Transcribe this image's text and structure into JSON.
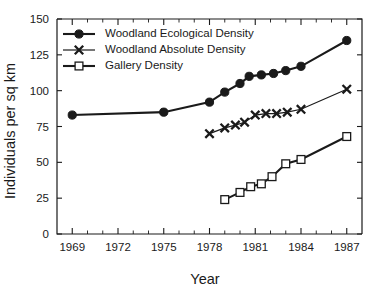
{
  "chart_data": {
    "type": "line",
    "title": "",
    "xlabel": "Year",
    "ylabel": "Individuals per sq km",
    "xlim": [
      1968,
      1988
    ],
    "ylim": [
      0,
      150
    ],
    "grid": false,
    "legend_position": "top-left",
    "x_ticks_major": [
      1969,
      1972,
      1975,
      1978,
      1981,
      1984,
      1987
    ],
    "x_tick_labels": [
      "1969",
      "1972",
      "1975",
      "1978",
      "1981",
      "1984",
      "1987"
    ],
    "x_ticks_minor": [
      1970,
      1971,
      1973,
      1974,
      1976,
      1977,
      1979,
      1980,
      1982,
      1983,
      1985,
      1986
    ],
    "y_ticks": [
      0,
      25,
      50,
      75,
      100,
      125,
      150
    ],
    "y_tick_labels": [
      "0",
      "25",
      "50",
      "75",
      "100",
      "125",
      "150"
    ],
    "series": [
      {
        "name": "Woodland Ecological Density",
        "marker": "filled-circle",
        "line": "thick",
        "x": [
          1969,
          1975,
          1978,
          1979,
          1980,
          1980.6,
          1981.4,
          1982.2,
          1983,
          1984,
          1987
        ],
        "values": [
          83,
          85,
          92,
          99,
          105,
          110,
          111,
          112,
          114,
          117,
          135
        ]
      },
      {
        "name": "Woodland Absolute Density",
        "marker": "x-cross",
        "line": "thin",
        "x": [
          1978,
          1979,
          1979.7,
          1980.3,
          1981,
          1981.7,
          1982.4,
          1983.1,
          1984,
          1987
        ],
        "values": [
          70,
          74,
          76,
          78,
          83,
          84,
          84,
          85,
          87,
          101
        ]
      },
      {
        "name": "Gallery Density",
        "marker": "open-square",
        "line": "thick",
        "x": [
          1979,
          1980,
          1980.7,
          1981.4,
          1982.1,
          1983,
          1984,
          1987
        ],
        "values": [
          24,
          29,
          33,
          35,
          40,
          49,
          52,
          68
        ]
      }
    ],
    "legend_entries": [
      "Woodland Ecological Density",
      "Woodland Absolute Density",
      "Gallery Density"
    ]
  },
  "colors": {
    "ink": "#1a1a1a",
    "background": "#ffffff",
    "marker_fill": "#ffffff"
  }
}
